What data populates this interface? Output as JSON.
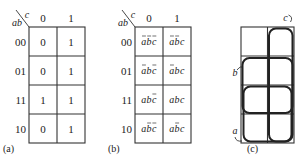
{
  "figure": {
    "maps": [
      {
        "id": "a",
        "label": "(a)",
        "row_var": "ab",
        "col_var": "c",
        "col_headers": [
          "0",
          "1"
        ],
        "row_headers": [
          "00",
          "01",
          "11",
          "10"
        ],
        "cells": [
          [
            "0",
            "1"
          ],
          [
            "0",
            "1"
          ],
          [
            "1",
            "1"
          ],
          [
            "0",
            "1"
          ]
        ]
      },
      {
        "id": "b",
        "label": "(b)",
        "row_var": "ab",
        "col_var": "c",
        "col_headers": [
          "0",
          "1"
        ],
        "row_headers": [
          "00",
          "01",
          "11",
          "10"
        ],
        "cells": [
          [
            {
              "t": "abc",
              "bar": [
                0,
                1,
                2
              ]
            },
            {
              "t": "abc",
              "bar": [
                0,
                1
              ]
            }
          ],
          [
            {
              "t": "abc",
              "bar": [
                0,
                2
              ]
            },
            {
              "t": "abc",
              "bar": [
                0
              ]
            }
          ],
          [
            {
              "t": "abc",
              "bar": [
                2
              ]
            },
            {
              "t": "abc",
              "bar": []
            }
          ],
          [
            {
              "t": "abc",
              "bar": [
                1,
                2
              ]
            },
            {
              "t": "abc",
              "bar": [
                1
              ]
            }
          ]
        ]
      },
      {
        "id": "c",
        "label": "(c)",
        "groups": [
          {
            "name": "c",
            "label": "c",
            "covers": "column c=1, all rows"
          },
          {
            "name": "b",
            "label": "b",
            "covers": "rows 01 and 11"
          },
          {
            "name": "a",
            "label": "a",
            "covers": "rows 11 and 10"
          }
        ]
      }
    ]
  }
}
